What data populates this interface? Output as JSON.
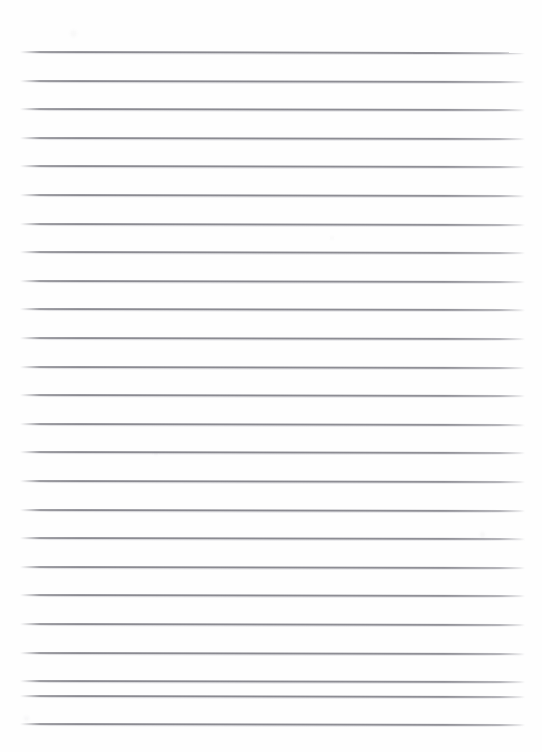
{
  "document": {
    "kind": "scanned-lined-paper",
    "title": "Blank Lined Paper",
    "page_width": 542,
    "page_height": 752,
    "background_color": "#fefefe",
    "has_text": false,
    "has_header": false,
    "has_margin_rule": false,
    "body_text": ""
  },
  "ruling": {
    "line_color": "#8a8a91",
    "line_shadow_color": "#cdcdd2",
    "line_count": 25,
    "line_thickness_px": 2,
    "line_spacing_px": 28.6,
    "first_line_y": 51,
    "last_line_y": 722,
    "line_left_x": 20,
    "line_right_x": 525,
    "line_length_px": 505,
    "skew_deg": 0.12,
    "lines": [
      {
        "index": 1,
        "y": 51.0,
        "left": 20,
        "width": 505,
        "skew": 0.14
      },
      {
        "index": 2,
        "y": 79.6,
        "left": 20,
        "width": 505,
        "skew": 0.12
      },
      {
        "index": 3,
        "y": 108.2,
        "left": 20,
        "width": 505,
        "skew": 0.13
      },
      {
        "index": 4,
        "y": 136.8,
        "left": 20,
        "width": 505,
        "skew": 0.11
      },
      {
        "index": 5,
        "y": 165.4,
        "left": 20,
        "width": 505,
        "skew": 0.12
      },
      {
        "index": 6,
        "y": 194.0,
        "left": 20,
        "width": 505,
        "skew": 0.13
      },
      {
        "index": 7,
        "y": 222.6,
        "left": 20,
        "width": 505,
        "skew": 0.12
      },
      {
        "index": 8,
        "y": 251.2,
        "left": 20,
        "width": 505,
        "skew": 0.11
      },
      {
        "index": 9,
        "y": 279.8,
        "left": 20,
        "width": 505,
        "skew": 0.12
      },
      {
        "index": 10,
        "y": 308.4,
        "left": 20,
        "width": 505,
        "skew": 0.13
      },
      {
        "index": 11,
        "y": 337.0,
        "left": 20,
        "width": 505,
        "skew": 0.12
      },
      {
        "index": 12,
        "y": 365.6,
        "left": 20,
        "width": 505,
        "skew": 0.11
      },
      {
        "index": 13,
        "y": 394.2,
        "left": 20,
        "width": 505,
        "skew": 0.12
      },
      {
        "index": 14,
        "y": 422.8,
        "left": 20,
        "width": 505,
        "skew": 0.13
      },
      {
        "index": 15,
        "y": 451.4,
        "left": 20,
        "width": 505,
        "skew": 0.12
      },
      {
        "index": 16,
        "y": 480.0,
        "left": 20,
        "width": 505,
        "skew": 0.11
      },
      {
        "index": 17,
        "y": 508.6,
        "left": 20,
        "width": 505,
        "skew": 0.12
      },
      {
        "index": 18,
        "y": 537.2,
        "left": 20,
        "width": 505,
        "skew": 0.13
      },
      {
        "index": 19,
        "y": 565.8,
        "left": 20,
        "width": 505,
        "skew": 0.12
      },
      {
        "index": 20,
        "y": 594.4,
        "left": 20,
        "width": 505,
        "skew": 0.11
      },
      {
        "index": 21,
        "y": 623.0,
        "left": 20,
        "width": 505,
        "skew": 0.12
      },
      {
        "index": 22,
        "y": 651.6,
        "left": 20,
        "width": 505,
        "skew": 0.13
      },
      {
        "index": 23,
        "y": 680.2,
        "left": 20,
        "width": 505,
        "skew": 0.12
      },
      {
        "index": 24,
        "y": 694.5,
        "left": 20,
        "width": 505,
        "skew": 0.12
      },
      {
        "index": 25,
        "y": 722.6,
        "left": 20,
        "width": 505,
        "skew": 0.11
      }
    ]
  },
  "scan_artifacts": {
    "specks": [
      {
        "x": 480,
        "y": 532,
        "size": 5,
        "opacity": 0.055
      },
      {
        "x": 70,
        "y": 30,
        "size": 7,
        "opacity": 0.04
      },
      {
        "x": 24,
        "y": 716,
        "size": 5,
        "opacity": 0.05
      },
      {
        "x": 154,
        "y": 452,
        "size": 4,
        "opacity": 0.035
      },
      {
        "x": 330,
        "y": 236,
        "size": 4,
        "opacity": 0.03
      }
    ]
  }
}
